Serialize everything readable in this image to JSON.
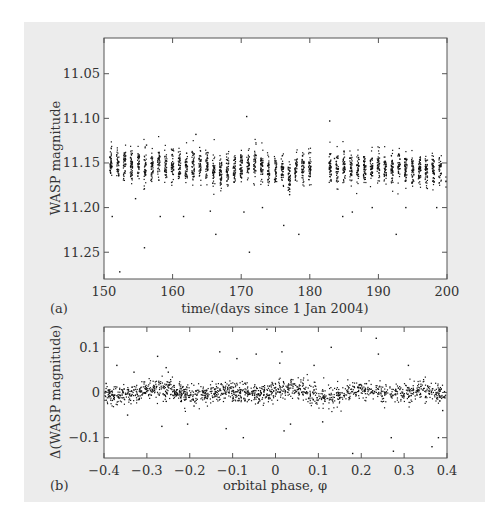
{
  "chart_data": [
    {
      "id": "a",
      "panel_label": "(a)",
      "type": "scatter",
      "title": "",
      "xlabel": "time/(days since 1 Jan 2004)",
      "ylabel": "WASP magnitude",
      "xlim": [
        150,
        200
      ],
      "ylim": [
        11.28,
        11.01
      ],
      "y_inverted": true,
      "xticks": [
        150,
        160,
        170,
        180,
        190,
        200
      ],
      "yticks": [
        11.05,
        11.1,
        11.15,
        11.2,
        11.25
      ],
      "ytick_labels": [
        "11.05",
        "11.10",
        "11.15",
        "11.20",
        "11.25"
      ],
      "grid": false,
      "description": "Nightly clusters of photometric points centred near 11.15 mag with spread ~0.02 mag; gap between ~180.5 and ~182.8 days; scattered outliers between 11.10 and 11.27.",
      "nights": [
        151,
        152,
        153,
        154,
        155,
        156,
        157,
        158,
        159,
        160,
        161,
        162,
        163,
        164,
        165,
        166,
        167,
        168,
        169,
        170,
        171,
        172,
        173,
        174,
        175,
        176,
        177,
        178,
        179,
        180,
        183,
        184,
        185,
        186,
        187,
        188,
        189,
        190,
        191,
        192,
        193,
        194,
        195,
        196,
        197,
        198,
        199,
        200
      ],
      "night_mean_mag": [
        11.15,
        11.151,
        11.15,
        11.152,
        11.151,
        11.155,
        11.152,
        11.151,
        11.152,
        11.151,
        11.152,
        11.153,
        11.152,
        11.153,
        11.152,
        11.16,
        11.157,
        11.156,
        11.156,
        11.155,
        11.152,
        11.154,
        11.153,
        11.155,
        11.156,
        11.157,
        11.165,
        11.158,
        11.156,
        11.155,
        11.155,
        11.157,
        11.156,
        11.156,
        11.155,
        11.154,
        11.154,
        11.155,
        11.154,
        11.155,
        11.154,
        11.156,
        11.16,
        11.157,
        11.156,
        11.155,
        11.157,
        11.17
      ],
      "outliers": [
        [
          151.2,
          11.21
        ],
        [
          152.3,
          11.272
        ],
        [
          154.6,
          11.19
        ],
        [
          155.9,
          11.245
        ],
        [
          156.2,
          11.13
        ],
        [
          158.2,
          11.21
        ],
        [
          161.6,
          11.21
        ],
        [
          163.4,
          11.118
        ],
        [
          165.5,
          11.204
        ],
        [
          166.3,
          11.23
        ],
        [
          170.4,
          11.205
        ],
        [
          170.8,
          11.098
        ],
        [
          171.2,
          11.25
        ],
        [
          173.1,
          11.2
        ],
        [
          176.2,
          11.22
        ],
        [
          178.4,
          11.23
        ],
        [
          182.9,
          11.103
        ],
        [
          183.6,
          11.145
        ],
        [
          184.8,
          11.21
        ],
        [
          186.2,
          11.205
        ],
        [
          189.1,
          11.2
        ],
        [
          192.6,
          11.23
        ],
        [
          194.0,
          11.2
        ],
        [
          198.5,
          11.2
        ]
      ]
    },
    {
      "id": "b",
      "panel_label": "(b)",
      "type": "scatter",
      "title": "",
      "xlabel": "orbital phase, φ",
      "ylabel": "Δ(WASP magnitude)",
      "xlim": [
        -0.4,
        0.4
      ],
      "ylim": [
        -0.145,
        0.145
      ],
      "xticks": [
        -0.4,
        -0.3,
        -0.2,
        -0.1,
        0,
        0.1,
        0.2,
        0.3,
        0.4
      ],
      "xtick_labels": [
        "−0.4",
        "−0.3",
        "−0.2",
        "−0.1",
        "0",
        "0.1",
        "0.2",
        "0.3",
        "0.4"
      ],
      "yticks": [
        -0.1,
        0,
        0.1
      ],
      "ytick_labels": [
        "−0.1",
        "0",
        "0.1"
      ],
      "grid": false,
      "description": "Phase-folded residuals: dense band around 0 with spread ~0.02; no clear transit dip; scattered outliers up to about ±0.13.",
      "outliers": [
        [
          -0.395,
          0.02
        ],
        [
          -0.37,
          0.06
        ],
        [
          -0.345,
          -0.05
        ],
        [
          -0.33,
          0.045
        ],
        [
          -0.275,
          0.08
        ],
        [
          -0.265,
          -0.075
        ],
        [
          -0.255,
          0.055
        ],
        [
          -0.25,
          0.045
        ],
        [
          -0.205,
          -0.07
        ],
        [
          -0.19,
          -0.03
        ],
        [
          -0.13,
          0.09
        ],
        [
          -0.115,
          -0.08
        ],
        [
          -0.09,
          0.075
        ],
        [
          -0.075,
          -0.1
        ],
        [
          -0.045,
          0.085
        ],
        [
          -0.02,
          0.14
        ],
        [
          0.01,
          0.065
        ],
        [
          0.015,
          0.09
        ],
        [
          0.02,
          -0.085
        ],
        [
          0.035,
          -0.07
        ],
        [
          0.09,
          0.06
        ],
        [
          0.11,
          -0.065
        ],
        [
          0.13,
          0.1
        ],
        [
          0.18,
          -0.135
        ],
        [
          0.235,
          0.12
        ],
        [
          0.24,
          0.085
        ],
        [
          0.27,
          -0.1
        ],
        [
          0.275,
          -0.13
        ],
        [
          0.31,
          0.06
        ],
        [
          0.365,
          -0.12
        ],
        [
          0.38,
          -0.1
        ],
        [
          0.39,
          -0.04
        ]
      ]
    }
  ]
}
